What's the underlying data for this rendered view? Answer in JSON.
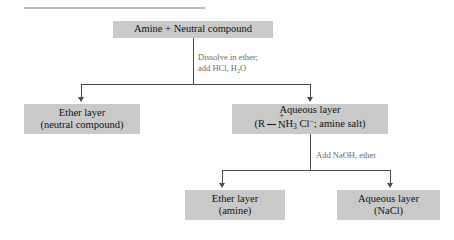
{
  "figure": {
    "box_fill_color": "#c9c9c9",
    "line_color": "#4a4a4a",
    "annotation_color": "#6a6a6a",
    "text_color": "#111111"
  },
  "nodes": {
    "start": {
      "line1": "Amine  +  Neutral compound"
    },
    "ether_layer_neutral": {
      "line1": "Ether layer",
      "line2": "(neutral compound)"
    },
    "aqueous_layer_salt": {
      "line1": "Aqueous layer",
      "formula_open": "(R",
      "formula_n": "N",
      "formula_charge": "+",
      "formula_h": "H",
      "formula_h_count": "3",
      "formula_cl": "Cl",
      "formula_cl_charge": "−",
      "formula_tail": "; amine salt)"
    },
    "ether_layer_amine": {
      "line1": "Ether layer",
      "line2": "(amine)"
    },
    "aqueous_layer_nacl": {
      "line1": "Aqueous layer",
      "line2": "(NaCl)"
    }
  },
  "annotations": {
    "step1": {
      "line1": "Dissolve in ether;",
      "line2_pre": "add HCl, H",
      "line2_sub": "2",
      "line2_post": "O"
    },
    "step2": {
      "line1": "Add NaOH, ether"
    }
  }
}
